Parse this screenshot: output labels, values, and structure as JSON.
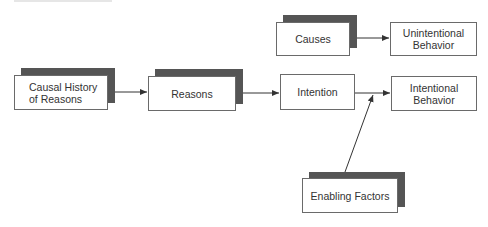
{
  "diagram": {
    "nodes": [
      {
        "id": "causal-history",
        "label": "Causal History\nof Reasons",
        "shadow": true
      },
      {
        "id": "reasons",
        "label": "Reasons",
        "shadow": true
      },
      {
        "id": "intention",
        "label": "Intention",
        "shadow": false
      },
      {
        "id": "intentional-behavior",
        "label": "Intentional\nBehavior",
        "shadow": false
      },
      {
        "id": "causes",
        "label": "Causes",
        "shadow": true
      },
      {
        "id": "unintentional-behavior",
        "label": "Unintentional\nBehavior",
        "shadow": false
      },
      {
        "id": "enabling-factors",
        "label": "Enabling Factors",
        "shadow": true
      }
    ],
    "edges": [
      {
        "from": "causal-history",
        "to": "reasons"
      },
      {
        "from": "reasons",
        "to": "intention"
      },
      {
        "from": "intention",
        "to": "intentional-behavior"
      },
      {
        "from": "causes",
        "to": "unintentional-behavior"
      },
      {
        "from": "enabling-factors",
        "to": "intention-to-intentional-behavior-edge"
      }
    ],
    "colors": {
      "shadow": "#555555",
      "border": "#6a6a6a",
      "text": "#333333",
      "line": "#333333"
    }
  }
}
